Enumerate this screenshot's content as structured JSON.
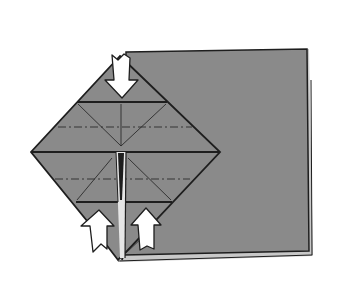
{
  "diagram": {
    "type": "origami-step",
    "colors": {
      "background": "#ffffff",
      "paper": "#8a8a8a",
      "paper_edge": "#1e1e1e",
      "back_layer_edge": "#c8c8c8",
      "arrow_fill": "#ffffff",
      "arrow_stroke": "#1e1e1e"
    },
    "elements": {
      "square_sheet": "square-sheet",
      "diamond_flap": "diamond-flap",
      "valley_folds": [
        "horizontal-fold-upper",
        "horizontal-fold-center",
        "horizontal-fold-lower"
      ],
      "mountain_folds_dash_dot": [
        "dash-dot-fold-upper",
        "dash-dot-fold-lower"
      ],
      "arrows": [
        {
          "id": "arrow-top",
          "direction": "down"
        },
        {
          "id": "arrow-bottom-left",
          "direction": "up"
        },
        {
          "id": "arrow-bottom-right",
          "direction": "up"
        }
      ]
    }
  }
}
